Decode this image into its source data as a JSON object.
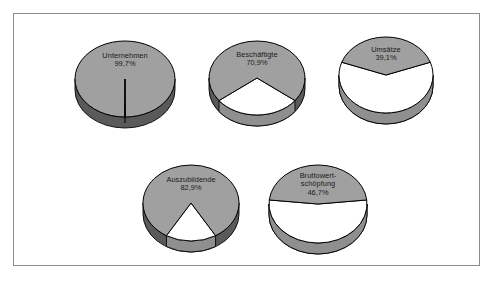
{
  "figure": {
    "background_color": "#ffffff",
    "border_color": "#8c8c8c"
  },
  "style": {
    "slice_fill": "#a0a0a0",
    "slice_fill_secondary": "#ffffff",
    "side_fill": "#5a5a5a",
    "side_fill_secondary": "#8f8f8f",
    "outline_color": "#000000",
    "label_color": "#1a1a1a"
  },
  "chart_data": [
    {
      "type": "pie",
      "title": "Unternehmen",
      "name": "unternehmen",
      "labels": [
        "Unternehmen",
        "Rest"
      ],
      "values": [
        99.7,
        0.3
      ],
      "value_label": "99,7%",
      "title_lines": [
        "Unternehmen"
      ],
      "colors": [
        "#a0a0a0",
        "#ffffff"
      ],
      "threed": true,
      "exploded": false
    },
    {
      "type": "pie",
      "title": "Beschäftigte",
      "name": "beschaeftigte",
      "labels": [
        "Beschäftigte",
        "Rest"
      ],
      "values": [
        70.9,
        29.1
      ],
      "value_label": "70,9%",
      "title_lines": [
        "Beschäftigte"
      ],
      "colors": [
        "#a0a0a0",
        "#ffffff"
      ],
      "threed": true,
      "exploded": true
    },
    {
      "type": "pie",
      "title": "Umsätze",
      "name": "umsaetze",
      "labels": [
        "Umsätze",
        "Rest"
      ],
      "values": [
        39.1,
        60.9
      ],
      "value_label": "39,1%",
      "title_lines": [
        "Umsätze"
      ],
      "colors": [
        "#a0a0a0",
        "#ffffff"
      ],
      "threed": true,
      "exploded": false
    },
    {
      "type": "pie",
      "title": "Auszubildende",
      "name": "auszubildende",
      "labels": [
        "Auszubildende",
        "Rest"
      ],
      "values": [
        82.9,
        17.1
      ],
      "value_label": "82,9%",
      "title_lines": [
        "Auszubildende"
      ],
      "colors": [
        "#a0a0a0",
        "#ffffff"
      ],
      "threed": true,
      "exploded": true
    },
    {
      "type": "pie",
      "title": "Bruttowertschöpfung",
      "name": "bruttowertschoepfung",
      "labels": [
        "Bruttowertschöpfung",
        "Rest"
      ],
      "values": [
        46.7,
        53.3
      ],
      "value_label": "46,7%",
      "title_lines": [
        "Bruttowert-",
        "schöpfung"
      ],
      "colors": [
        "#a0a0a0",
        "#ffffff"
      ],
      "threed": true,
      "exploded": false
    }
  ],
  "layout": {
    "positions": [
      {
        "left": 58,
        "top": 24,
        "rx": 50,
        "ry": 38,
        "depth": 11,
        "label_top": 14
      },
      {
        "left": 192,
        "top": 24,
        "rx": 48,
        "ry": 37,
        "depth": 11,
        "label_top": 13
      },
      {
        "left": 322,
        "top": 20,
        "rx": 47,
        "ry": 38,
        "depth": 11,
        "label_top": 12
      },
      {
        "left": 126,
        "top": 148,
        "rx": 48,
        "ry": 38,
        "depth": 11,
        "label_top": 14
      },
      {
        "left": 252,
        "top": 148,
        "rx": 49,
        "ry": 39,
        "depth": 11,
        "label_top": 10
      }
    ]
  }
}
